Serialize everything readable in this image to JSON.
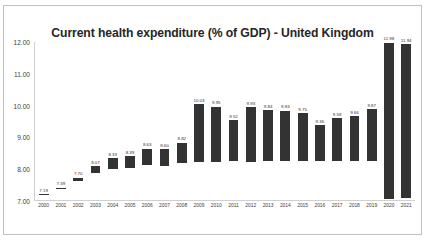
{
  "chart_data": {
    "type": "bar",
    "title": "Current health expenditure (% of GDP) - United Kingdom",
    "xlabel": "",
    "ylabel": "",
    "ylim": [
      7.0,
      12.0
    ],
    "ytick_labels": [
      "12.00",
      "11.00",
      "10.00",
      "9.00",
      "8.00",
      "7.00"
    ],
    "ytick_values": [
      12.0,
      11.0,
      10.0,
      9.0,
      8.0,
      7.0
    ],
    "grid": false,
    "legend": false,
    "bar_color": "#333333",
    "categories": [
      "2000",
      "2001",
      "2002",
      "2003",
      "2004",
      "2005",
      "2006",
      "2007",
      "2008",
      "2009",
      "2010",
      "2011",
      "2012",
      "2013",
      "2014",
      "2015",
      "2016",
      "2017",
      "2018",
      "2019",
      "2020",
      "2021"
    ],
    "values": [
      7.19,
      7.39,
      7.7,
      8.07,
      8.33,
      8.39,
      8.63,
      8.6,
      8.82,
      10.03,
      9.95,
      9.52,
      9.93,
      9.84,
      9.83,
      9.75,
      9.36,
      9.58,
      9.66,
      9.87,
      11.98,
      11.94
    ],
    "value_labels": [
      "7.19",
      "7.39",
      "7.70",
      "8.07",
      "8.33",
      "8.39",
      "8.63",
      "8.60",
      "8.82",
      "10.03",
      "9.95",
      "9.52",
      "9.93",
      "9.84",
      "9.83",
      "9.75",
      "9.36",
      "9.58",
      "9.66",
      "9.87",
      "11.98",
      "11.94"
    ]
  },
  "watermark": ""
}
